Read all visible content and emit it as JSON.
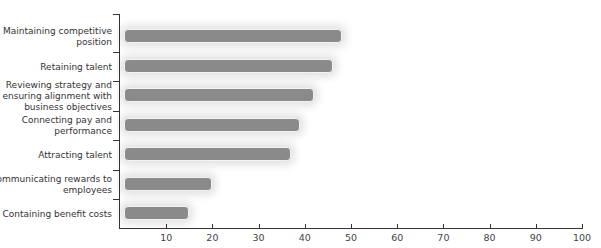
{
  "chart_data": {
    "type": "bar",
    "orientation": "horizontal",
    "title": "",
    "xlabel": "",
    "ylabel": "",
    "categories": [
      "Maintaining competitive position",
      "Retaining talent",
      "Reviewing strategy and ensuring alignment with business objectives",
      "Connecting pay and performance",
      "Attracting talent",
      "Communicating rewards to employees",
      "Containing benefit costs"
    ],
    "values": [
      48,
      46,
      42,
      39,
      37,
      20,
      15
    ],
    "xlim": [
      0,
      100
    ],
    "x_ticks": [
      "10",
      "20",
      "30",
      "40",
      "50",
      "60",
      "70",
      "80",
      "90",
      "100"
    ],
    "grid": false,
    "legend": null,
    "bar_color": "#8a8a8a"
  },
  "labels": {
    "cat0_l1": "Maintaining competitive",
    "cat0_l2": "position",
    "cat1_l1": "Retaining talent",
    "cat2_l1": "Reviewing strategy and",
    "cat2_l2": "ensuring alignment with",
    "cat2_l3": "business objectives",
    "cat3_l1": "Connecting pay and",
    "cat3_l2": "performance",
    "cat4_l1": "Attracting talent",
    "cat5_l1": "Communicating rewards to",
    "cat5_l2": "employees",
    "cat6_l1": "Containing benefit costs"
  }
}
